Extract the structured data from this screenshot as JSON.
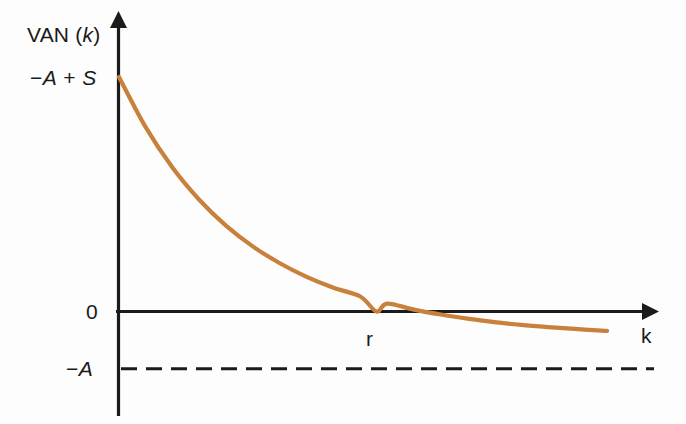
{
  "figure": {
    "background_color": "#fdfdfd",
    "axis_color": "#1b1b1b",
    "curve_color": "#c8813c"
  },
  "labels": {
    "y_axis_title_plain": "VAN (",
    "y_axis_title_italic": "k",
    "y_axis_title_close": ")",
    "y_axis_title_full": "VAN (k)",
    "y_intercept_sign": "−",
    "y_intercept_A": "A",
    "y_intercept_plus": " + ",
    "y_intercept_S": "S",
    "y_intercept_full": "−A + S",
    "zero": "0",
    "neg_A_sign": "−",
    "neg_A_letter": "A",
    "neg_A_full": "−A",
    "x_root": "r",
    "x_axis_title": "k"
  },
  "chart_data": {
    "type": "line",
    "title": "",
    "subtitle": "",
    "xlabel": "k",
    "ylabel": "VAN (k)",
    "grid": false,
    "legend": null,
    "xlim": [
      0,
      1
    ],
    "ylim": [
      -1,
      1
    ],
    "annotations": [
      {
        "name": "y-intercept",
        "text": "−A + S",
        "x": 0,
        "y": 0.86,
        "axis": "y"
      },
      {
        "name": "zero-level",
        "text": "0",
        "x": 0,
        "y": 0,
        "axis": "y"
      },
      {
        "name": "asymptote-level",
        "text": "−A",
        "x": 0,
        "y": -0.21,
        "axis": "y"
      },
      {
        "name": "root",
        "text": "r",
        "x": 0.48,
        "y": 0,
        "axis": "x"
      },
      {
        "name": "x-axis-name",
        "text": "k",
        "x": 0.98,
        "y": 0,
        "axis": "x"
      }
    ],
    "series": [
      {
        "name": "VAN(k)",
        "color": "#c8813c",
        "style": "solid",
        "x": [
          0.0,
          0.05,
          0.1,
          0.15,
          0.2,
          0.25,
          0.3,
          0.35,
          0.4,
          0.45,
          0.48,
          0.5,
          0.55,
          0.6,
          0.65,
          0.7,
          0.75,
          0.8,
          0.85,
          0.9,
          0.91
        ],
        "y": [
          0.86,
          0.675,
          0.527,
          0.409,
          0.314,
          0.238,
          0.177,
          0.127,
          0.087,
          0.055,
          0.0,
          0.029,
          0.007,
          -0.011,
          -0.026,
          -0.039,
          -0.049,
          -0.057,
          -0.064,
          -0.07,
          -0.071
        ]
      },
      {
        "name": "asymptote -A",
        "color": "#1b1b1b",
        "style": "dashed",
        "x": [
          0.0,
          1.0
        ],
        "y": [
          -0.21,
          -0.21
        ]
      }
    ]
  }
}
